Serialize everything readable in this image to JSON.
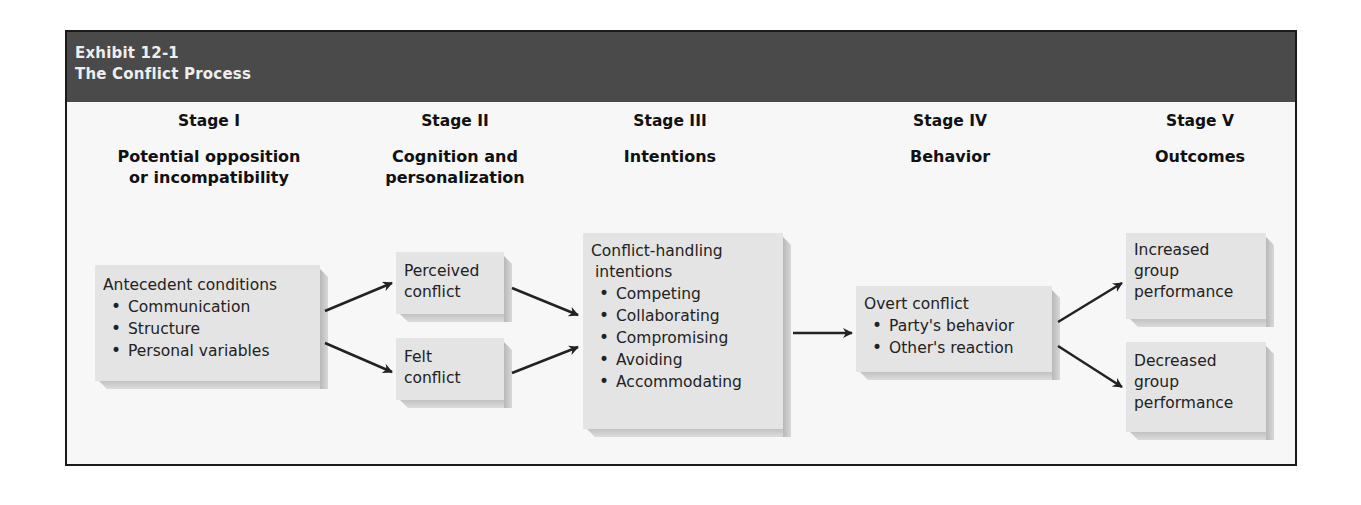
{
  "header": {
    "exhibit": "Exhibit 12-1",
    "title": "The Conflict Process"
  },
  "stages": [
    {
      "number": "Stage I",
      "name_line1": "Potential opposition",
      "name_line2": "or incompatibility"
    },
    {
      "number": "Stage II",
      "name_line1": "Cognition and",
      "name_line2": "personalization"
    },
    {
      "number": "Stage III",
      "name_line1": "Intentions",
      "name_line2": ""
    },
    {
      "number": "Stage IV",
      "name_line1": "Behavior",
      "name_line2": ""
    },
    {
      "number": "Stage V",
      "name_line1": "Outcomes",
      "name_line2": ""
    }
  ],
  "boxes": {
    "antecedent": {
      "title": "Antecedent conditions",
      "items": [
        "Communication",
        "Structure",
        "Personal variables"
      ]
    },
    "perceived": {
      "line1": "Perceived",
      "line2": "conflict"
    },
    "felt": {
      "line1": "Felt",
      "line2": "conflict"
    },
    "intentions": {
      "line1": "Conflict-handling",
      "line2": "intentions",
      "items": [
        "Competing",
        "Collaborating",
        "Compromising",
        "Avoiding",
        "Accommodating"
      ]
    },
    "overt": {
      "title": "Overt conflict",
      "items": [
        "Party's behavior",
        "Other's reaction"
      ]
    },
    "increased": {
      "line1": "Increased",
      "line2": "group",
      "line3": "performance"
    },
    "decreased": {
      "line1": "Decreased",
      "line2": "group",
      "line3": "performance"
    }
  },
  "colors": {
    "header_bg": "#4a4a4a",
    "header_text": "#eeeeee",
    "box_fill": "#e4e4e4",
    "arrow": "#222222"
  }
}
